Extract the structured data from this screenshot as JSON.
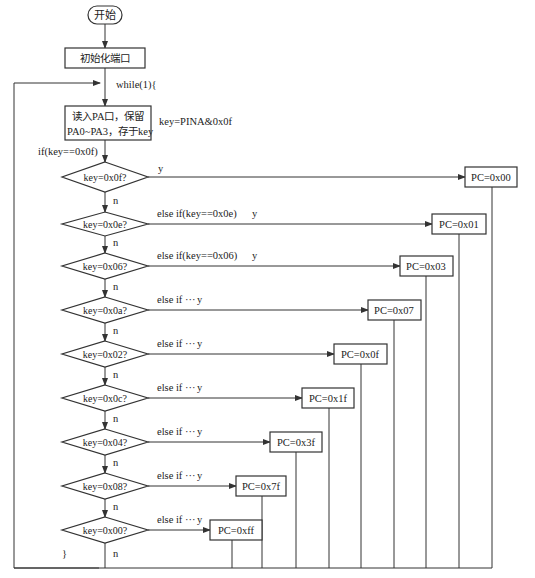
{
  "flowchart": {
    "start": "开始",
    "init": "初始化端口",
    "loop_open": "while(1){",
    "loop_close": "}",
    "read_lines": [
      "读入PA口，保留",
      "PA0~PA3，存于key"
    ],
    "read_annotation": "key=PINA&0x0f",
    "first_if": "if(key==0x0f)",
    "yes": "y",
    "no": "n",
    "decisions": [
      {
        "cond": "key=0x0f?",
        "branch": "",
        "result": "PC=0x00"
      },
      {
        "cond": "key=0x0e?",
        "branch": "else if(key==0x0e)",
        "result": "PC=0x01"
      },
      {
        "cond": "key=0x06?",
        "branch": "else if(key==0x06)",
        "result": "PC=0x03"
      },
      {
        "cond": "key=0x0a?",
        "branch": "else if ···",
        "result": "PC=0x07"
      },
      {
        "cond": "key=0x02?",
        "branch": "else if ···",
        "result": "PC=0x0f"
      },
      {
        "cond": "key=0x0c?",
        "branch": "else if ···",
        "result": "PC=0x1f"
      },
      {
        "cond": "key=0x04?",
        "branch": "else if ···",
        "result": "PC=0x3f"
      },
      {
        "cond": "key=0x08?",
        "branch": "else if ···",
        "result": "PC=0x7f"
      },
      {
        "cond": "key=0x00?",
        "branch": "else if ···",
        "result": "PC=0xff"
      }
    ]
  }
}
